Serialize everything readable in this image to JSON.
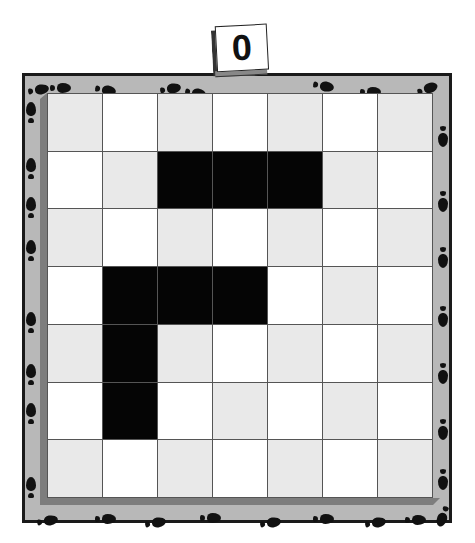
{
  "game": {
    "counter": {
      "label": "0"
    },
    "board": {
      "rows": 7,
      "cols": 7,
      "colors": {
        "light": "#ffffff",
        "gray": "#e9e9e9",
        "filled": "#050505",
        "frame": "#b8b8b8",
        "frame_border": "#1a1a1a",
        "gridline": "#555555"
      },
      "filled_cells": [
        [
          1,
          2
        ],
        [
          1,
          3
        ],
        [
          1,
          4
        ],
        [
          3,
          1
        ],
        [
          3,
          2
        ],
        [
          3,
          3
        ],
        [
          4,
          1
        ],
        [
          5,
          1
        ]
      ]
    },
    "decorations": {
      "footprints": [
        {
          "x": 33,
          "y": 79,
          "r": 80
        },
        {
          "x": 55,
          "y": 77,
          "r": 90
        },
        {
          "x": 100,
          "y": 79,
          "r": 100
        },
        {
          "x": 165,
          "y": 78,
          "r": 80
        },
        {
          "x": 190,
          "y": 82,
          "r": 100
        },
        {
          "x": 318,
          "y": 75,
          "r": 100
        },
        {
          "x": 365,
          "y": 81,
          "r": 90
        },
        {
          "x": 422,
          "y": 78,
          "r": 70
        },
        {
          "x": 26,
          "y": 102,
          "r": 0
        },
        {
          "x": 26,
          "y": 158,
          "r": 0
        },
        {
          "x": 26,
          "y": 197,
          "r": 0
        },
        {
          "x": 26,
          "y": 240,
          "r": 0
        },
        {
          "x": 26,
          "y": 312,
          "r": 0
        },
        {
          "x": 26,
          "y": 364,
          "r": 0
        },
        {
          "x": 26,
          "y": 403,
          "r": 0
        },
        {
          "x": 26,
          "y": 477,
          "r": 0
        },
        {
          "x": 438,
          "y": 125,
          "r": 180
        },
        {
          "x": 438,
          "y": 190,
          "r": 180
        },
        {
          "x": 438,
          "y": 246,
          "r": 180
        },
        {
          "x": 438,
          "y": 305,
          "r": 180
        },
        {
          "x": 438,
          "y": 362,
          "r": 180
        },
        {
          "x": 438,
          "y": 418,
          "r": 180
        },
        {
          "x": 438,
          "y": 468,
          "r": 180
        },
        {
          "x": 438,
          "y": 505,
          "r": 200
        },
        {
          "x": 42,
          "y": 510,
          "r": 80
        },
        {
          "x": 100,
          "y": 508,
          "r": 90
        },
        {
          "x": 150,
          "y": 512,
          "r": 80
        },
        {
          "x": 205,
          "y": 507,
          "r": 90
        },
        {
          "x": 265,
          "y": 512,
          "r": 80
        },
        {
          "x": 318,
          "y": 508,
          "r": 90
        },
        {
          "x": 370,
          "y": 512,
          "r": 80
        },
        {
          "x": 410,
          "y": 509,
          "r": 90
        }
      ]
    }
  }
}
